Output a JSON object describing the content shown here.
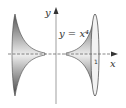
{
  "figure": {
    "equation_label": "y = x⁴",
    "x_axis_label": "x",
    "y_axis_label": "y",
    "tick_label": "1"
  }
}
